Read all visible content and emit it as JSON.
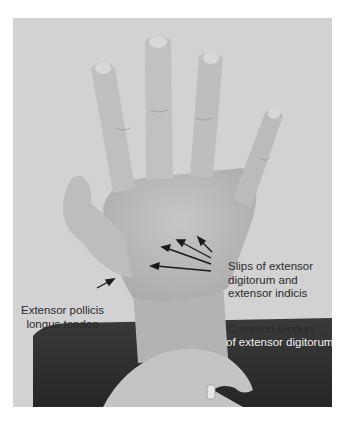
{
  "figure": {
    "labels": {
      "slips": [
        "Slips of extensor",
        "digitorum and",
        "extensor indicis"
      ],
      "extensor_pollicis_longus": [
        "Extensor pollicis",
        "longus tendon"
      ],
      "common_tendon": [
        "Common tendon",
        "of extensor digitorum"
      ]
    },
    "colors": {
      "background": "#d2d2d2",
      "skin": "#b9b9b9",
      "dark_band": "#2e2e2e",
      "label_text": "#2a2a2a",
      "label_text_light": "#f2f2f2",
      "arrow": "#1a1a1a"
    }
  }
}
